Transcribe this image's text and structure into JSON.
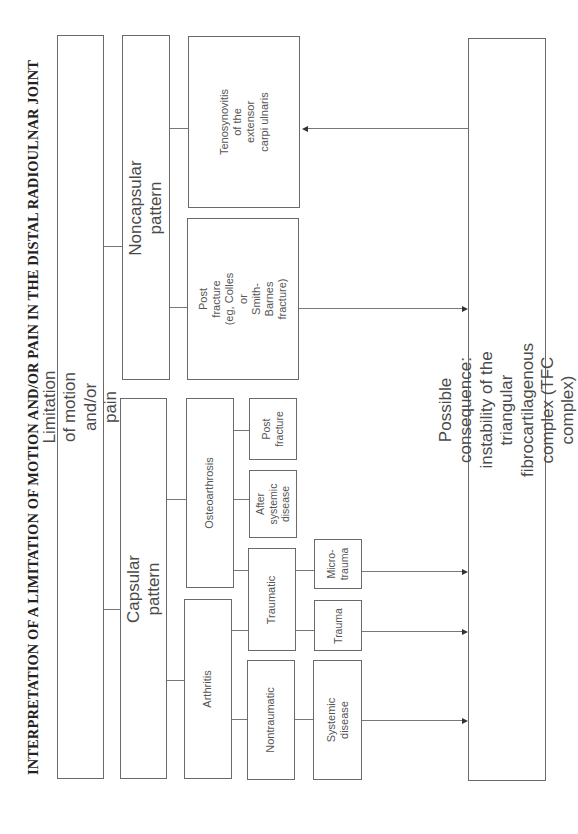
{
  "title": "INTERPRETATION OF A LIMITATION OF MOTION AND/OR PAIN IN THE DISTAL RADIOULNAR JOINT",
  "nodes": {
    "root": "Limitation of motion and/or pain",
    "capsular": "Capsular pattern",
    "noncapsular": "Noncapsular pattern",
    "arthritis": "Arthritis",
    "osteoarthrosis": "Osteoarthrosis",
    "nontraumatic": "Nontraumatic",
    "traumatic": "Traumatic",
    "after_systemic": "After\nsystemic\ndisease",
    "post_fracture_small": "Post\nfracture",
    "systemic_disease": "Systemic disease",
    "trauma": "Trauma",
    "microtrauma": "Micro-\ntrauma",
    "post_fracture_large": "Post fracture (eg, Colles or\nSmith-Barnes fracture)",
    "tenosynovitis": "Tenosynovitis of the extensor\ncarpi ulnaris",
    "consequence": "Possible consequence: instability of the triangular fibrocartilagenous complex (TFC complex)"
  },
  "edges": [
    [
      "root",
      "noncapsular"
    ],
    [
      "root",
      "capsular"
    ],
    [
      "noncapsular",
      "tenosynovitis"
    ],
    [
      "noncapsular",
      "post_fracture_large"
    ],
    [
      "capsular",
      "osteoarthrosis"
    ],
    [
      "capsular",
      "arthritis"
    ],
    [
      "osteoarthrosis",
      "post_fracture_small"
    ],
    [
      "osteoarthrosis",
      "after_systemic"
    ],
    [
      "osteoarthrosis",
      "traumatic"
    ],
    [
      "arthritis",
      "traumatic"
    ],
    [
      "arthritis",
      "nontraumatic"
    ],
    [
      "traumatic",
      "microtrauma"
    ],
    [
      "traumatic",
      "trauma"
    ],
    [
      "nontraumatic",
      "systemic_disease"
    ],
    [
      "microtrauma",
      "consequence"
    ],
    [
      "trauma",
      "consequence"
    ],
    [
      "systemic_disease",
      "consequence"
    ],
    [
      "post_fracture_large",
      "consequence"
    ],
    [
      "consequence",
      "tenosynovitis"
    ]
  ]
}
